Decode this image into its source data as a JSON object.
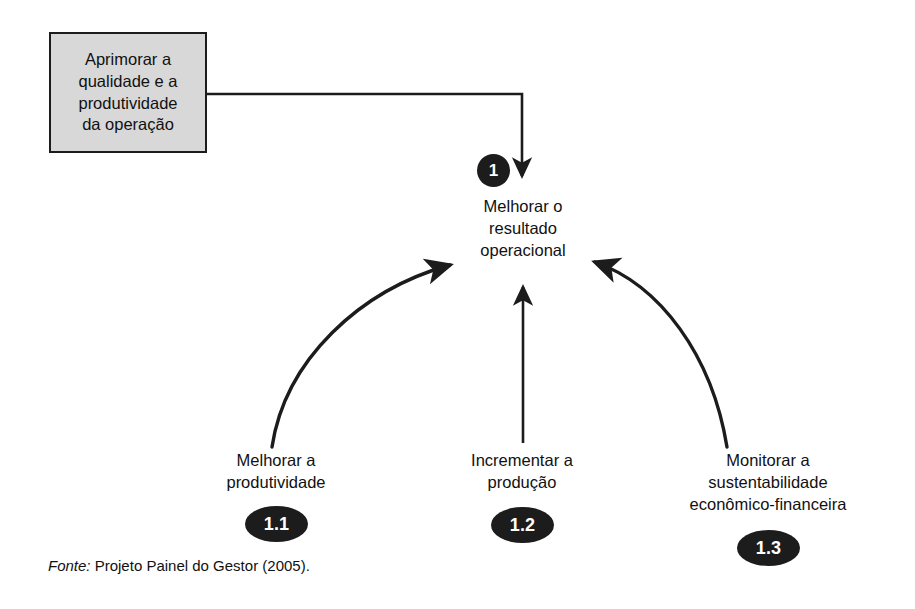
{
  "diagram": {
    "goal_box": {
      "text": "Aprimorar a\nqualidade e a\nprodutividade\nda operação",
      "fill_color": "#d8d8d8",
      "border_color": "#1c1c1c"
    },
    "nodes": [
      {
        "id": "center",
        "label": "Melhorar o\nresultado\noperacional",
        "badge": "1"
      },
      {
        "id": "left",
        "label": "Melhorar a\nprodutividade",
        "badge": "1.1"
      },
      {
        "id": "middle",
        "label": "Incrementar a\nprodução",
        "badge": "1.2"
      },
      {
        "id": "right",
        "label": "Monitorar a\nsustentabilidade\neconômico-financeira",
        "badge": "1.3"
      }
    ],
    "line_color": "#1c1c1c"
  },
  "footer": {
    "source_lead": "Fonte:",
    "source_text": " Projeto Painel do Gestor (2005)."
  }
}
